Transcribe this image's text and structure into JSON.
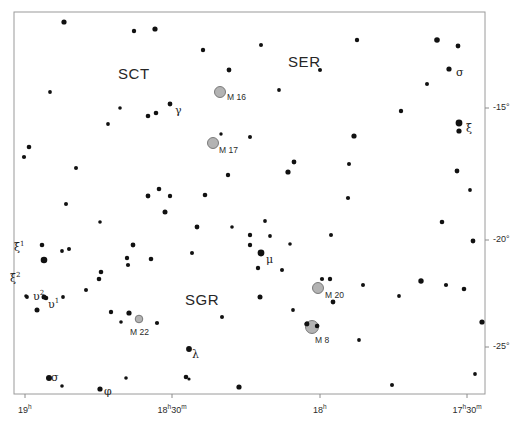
{
  "figure": {
    "kind": "star-chart",
    "background_color": "#ffffff",
    "frame_color": "#9a9a9a",
    "star_color": "#111111",
    "nebula_fill": "#b3b3b3",
    "nebula_stroke": "#6f6f6f",
    "tick_color": "#8c8c8c",
    "width": 521,
    "height": 424
  },
  "frame": {
    "x": 14,
    "y": 12,
    "w": 471,
    "h": 382
  },
  "constellation_labels": [
    {
      "name": "constellation-label-sct",
      "text": "SCT",
      "x": 118,
      "y": 65
    },
    {
      "name": "constellation-label-ser",
      "text": "SER",
      "x": 288,
      "y": 53
    },
    {
      "name": "constellation-label-sgr",
      "text": "SGR",
      "x": 185,
      "y": 291
    }
  ],
  "deep_sky_objects": [
    {
      "name": "messier-16",
      "label": "M 16",
      "x": 220,
      "y": 92,
      "r": 5.5,
      "label_dx": 7,
      "label_dy": 4
    },
    {
      "name": "messier-17",
      "label": "M 17",
      "x": 213,
      "y": 143,
      "r": 5.5,
      "label_dx": 6,
      "label_dy": 6
    },
    {
      "name": "messier-20",
      "label": "M 20",
      "x": 318,
      "y": 288,
      "r": 5.5,
      "label_dx": 7,
      "label_dy": 6
    },
    {
      "name": "messier-8",
      "label": "M 8",
      "x": 312,
      "y": 327,
      "r": 6.5,
      "label_dx": 3,
      "label_dy": 12
    },
    {
      "name": "messier-22",
      "label": "M 22",
      "x": 139,
      "y": 319,
      "r": 3.8,
      "label_dx": -9,
      "label_dy": 12
    }
  ],
  "greek_labels": [
    {
      "name": "star-label-gamma-sct",
      "base": "γ",
      "sup": "",
      "x": 175,
      "y": 104
    },
    {
      "name": "star-label-sigma-ser",
      "base": "σ",
      "sup": "",
      "x": 456,
      "y": 66
    },
    {
      "name": "star-label-xi-ser",
      "base": "ξ",
      "sup": "",
      "x": 466,
      "y": 122
    },
    {
      "name": "star-label-mu-sgr",
      "base": "μ",
      "sup": "",
      "x": 266,
      "y": 253
    },
    {
      "name": "star-label-xi1-sgr",
      "base": "ξ",
      "sup": "1",
      "x": 14,
      "y": 240
    },
    {
      "name": "star-label-xi2-sgr",
      "base": "ξ",
      "sup": "2",
      "x": 10,
      "y": 271
    },
    {
      "name": "star-label-upsilon2-sgr",
      "base": "υ",
      "sup": "2",
      "x": 33,
      "y": 289
    },
    {
      "name": "star-label-upsilon1-sgr",
      "base": "υ",
      "sup": "1",
      "x": 48,
      "y": 297
    },
    {
      "name": "star-label-lambda-sgr",
      "base": "λ",
      "sup": "",
      "x": 192,
      "y": 348
    },
    {
      "name": "star-label-sigma-sgr",
      "base": "σ",
      "sup": "",
      "x": 51,
      "y": 371
    },
    {
      "name": "star-label-phi-sgr",
      "base": "φ",
      "sup": "",
      "x": 104,
      "y": 385
    }
  ],
  "axes": {
    "dec_ticks": [
      {
        "name": "dec-tick-minus15",
        "text": "-15°",
        "value": -15,
        "y": 108
      },
      {
        "name": "dec-tick-minus20",
        "text": "-20°",
        "value": -20,
        "y": 240
      },
      {
        "name": "dec-tick-minus25",
        "text": "-25°",
        "value": -25,
        "y": 347
      }
    ],
    "ra_ticks": [
      {
        "name": "ra-tick-19h",
        "base": "19",
        "unit": "h",
        "minutes": "",
        "x": 25,
        "value": 19.0
      },
      {
        "name": "ra-tick-18h30m",
        "base": "18",
        "unit": "h",
        "minutes": "30",
        "minutes_unit": "m",
        "x": 172,
        "value": 18.5
      },
      {
        "name": "ra-tick-18h",
        "base": "18",
        "unit": "h",
        "minutes": "",
        "x": 320,
        "value": 18.0
      },
      {
        "name": "ra-tick-17h30m",
        "base": "17",
        "unit": "h",
        "minutes": "30",
        "minutes_unit": "m",
        "x": 467,
        "value": 17.5
      }
    ]
  },
  "chart_data": {
    "type": "scatter",
    "title": "",
    "xlabel": "Right Ascension",
    "ylabel": "Declination",
    "xlim": [
      19.0,
      17.4
    ],
    "ylim": [
      -27.5,
      -12.0
    ],
    "grid": false,
    "legend": null,
    "stars": [
      {
        "x": 64,
        "y": 22,
        "r": 2.6
      },
      {
        "x": 155,
        "y": 29,
        "r": 2.6
      },
      {
        "x": 134,
        "y": 31,
        "r": 2.2
      },
      {
        "x": 203,
        "y": 50,
        "r": 2.2
      },
      {
        "x": 203,
        "y": 50,
        "r": 0.1
      },
      {
        "x": 202,
        "y": 49,
        "r": 0.1
      },
      {
        "x": 261,
        "y": 45,
        "r": 2.0
      },
      {
        "x": 357,
        "y": 40,
        "r": 2.2
      },
      {
        "x": 437,
        "y": 40,
        "r": 2.8
      },
      {
        "x": 458,
        "y": 46,
        "r": 2.4
      },
      {
        "x": 50,
        "y": 92,
        "r": 1.9
      },
      {
        "x": 120,
        "y": 108,
        "r": 1.8
      },
      {
        "x": 170,
        "y": 104,
        "r": 2.4
      },
      {
        "x": 156,
        "y": 113,
        "r": 2.3
      },
      {
        "x": 148,
        "y": 116,
        "r": 2.3
      },
      {
        "x": 108,
        "y": 124,
        "r": 1.9
      },
      {
        "x": 229,
        "y": 70,
        "r": 2.4
      },
      {
        "x": 279,
        "y": 90,
        "r": 1.9
      },
      {
        "x": 320,
        "y": 70,
        "r": 2.0
      },
      {
        "x": 449,
        "y": 69,
        "r": 2.6
      },
      {
        "x": 427,
        "y": 84,
        "r": 2.0
      },
      {
        "x": 401,
        "y": 111,
        "r": 2.2
      },
      {
        "x": 459,
        "y": 123,
        "r": 3.4
      },
      {
        "x": 459,
        "y": 131,
        "r": 2.6
      },
      {
        "x": 29,
        "y": 147,
        "r": 2.3
      },
      {
        "x": 24,
        "y": 157,
        "r": 2.1
      },
      {
        "x": 221,
        "y": 134,
        "r": 1.7
      },
      {
        "x": 250,
        "y": 137,
        "r": 2.0
      },
      {
        "x": 354,
        "y": 136,
        "r": 2.6
      },
      {
        "x": 294,
        "y": 162,
        "r": 2.4
      },
      {
        "x": 349,
        "y": 164,
        "r": 2.0
      },
      {
        "x": 228,
        "y": 175,
        "r": 2.2
      },
      {
        "x": 159,
        "y": 189,
        "r": 2.3
      },
      {
        "x": 170,
        "y": 196,
        "r": 2.2
      },
      {
        "x": 66,
        "y": 204,
        "r": 2.0
      },
      {
        "x": 178,
        "y": 196,
        "r": 0.1
      },
      {
        "x": 76,
        "y": 168,
        "r": 2.0
      },
      {
        "x": 148,
        "y": 196,
        "r": 2.4
      },
      {
        "x": 288,
        "y": 172,
        "r": 2.6
      },
      {
        "x": 348,
        "y": 198,
        "r": 2.1
      },
      {
        "x": 457,
        "y": 171,
        "r": 2.4
      },
      {
        "x": 470,
        "y": 190,
        "r": 1.9
      },
      {
        "x": 205,
        "y": 195,
        "r": 2.3
      },
      {
        "x": 100,
        "y": 222,
        "r": 1.8
      },
      {
        "x": 165,
        "y": 212,
        "r": 2.5
      },
      {
        "x": 250,
        "y": 235,
        "r": 2.2
      },
      {
        "x": 250,
        "y": 245,
        "r": 2.2
      },
      {
        "x": 261,
        "y": 253,
        "r": 3.4
      },
      {
        "x": 258,
        "y": 268,
        "r": 2.2
      },
      {
        "x": 197,
        "y": 227,
        "r": 2.4
      },
      {
        "x": 232,
        "y": 227,
        "r": 1.8
      },
      {
        "x": 265,
        "y": 221,
        "r": 1.9
      },
      {
        "x": 290,
        "y": 244,
        "r": 1.8
      },
      {
        "x": 331,
        "y": 235,
        "r": 2.0
      },
      {
        "x": 442,
        "y": 222,
        "r": 2.3
      },
      {
        "x": 473,
        "y": 241,
        "r": 2.4
      },
      {
        "x": 133,
        "y": 245,
        "r": 2.4
      },
      {
        "x": 44,
        "y": 260,
        "r": 3.3
      },
      {
        "x": 42,
        "y": 245,
        "r": 2.3
      },
      {
        "x": 69,
        "y": 249,
        "r": 2.0
      },
      {
        "x": 26,
        "y": 296,
        "r": 1.8
      },
      {
        "x": 29,
        "y": 298,
        "r": 0.1
      },
      {
        "x": 72,
        "y": 246,
        "r": 0.1
      },
      {
        "x": 27,
        "y": 297,
        "r": 1.9
      },
      {
        "x": 46,
        "y": 298,
        "r": 2.3
      },
      {
        "x": 44,
        "y": 297,
        "r": 2.5
      },
      {
        "x": 37,
        "y": 310,
        "r": 2.5
      },
      {
        "x": 63,
        "y": 297,
        "r": 1.9
      },
      {
        "x": 99,
        "y": 279,
        "r": 2.3
      },
      {
        "x": 86,
        "y": 290,
        "r": 2.0
      },
      {
        "x": 76,
        "y": 290,
        "r": 0.1
      },
      {
        "x": 127,
        "y": 258,
        "r": 2.2
      },
      {
        "x": 128,
        "y": 265,
        "r": 2.1
      },
      {
        "x": 101,
        "y": 272,
        "r": 2.3
      },
      {
        "x": 151,
        "y": 259,
        "r": 2.3
      },
      {
        "x": 192,
        "y": 253,
        "r": 2.0
      },
      {
        "x": 129,
        "y": 313,
        "r": 2.6
      },
      {
        "x": 157,
        "y": 323,
        "r": 2.1
      },
      {
        "x": 222,
        "y": 317,
        "r": 2.0
      },
      {
        "x": 121,
        "y": 322,
        "r": 1.8
      },
      {
        "x": 111,
        "y": 312,
        "r": 2.2
      },
      {
        "x": 118,
        "y": 311,
        "r": 0.1
      },
      {
        "x": 62,
        "y": 251,
        "r": 1.9
      },
      {
        "x": 330,
        "y": 279,
        "r": 2.2
      },
      {
        "x": 333,
        "y": 302,
        "r": 2.4
      },
      {
        "x": 307,
        "y": 324,
        "r": 2.6
      },
      {
        "x": 317,
        "y": 326,
        "r": 2.4
      },
      {
        "x": 260,
        "y": 297,
        "r": 2.5
      },
      {
        "x": 270,
        "y": 236,
        "r": 1.9
      },
      {
        "x": 363,
        "y": 285,
        "r": 2.0
      },
      {
        "x": 358,
        "y": 288,
        "r": 0.1
      },
      {
        "x": 399,
        "y": 296,
        "r": 1.9
      },
      {
        "x": 421,
        "y": 281,
        "r": 2.7
      },
      {
        "x": 446,
        "y": 285,
        "r": 2.1
      },
      {
        "x": 464,
        "y": 289,
        "r": 2.3
      },
      {
        "x": 482,
        "y": 322,
        "r": 2.6
      },
      {
        "x": 359,
        "y": 340,
        "r": 1.9
      },
      {
        "x": 475,
        "y": 374,
        "r": 1.9
      },
      {
        "x": 189,
        "y": 349,
        "r": 2.9
      },
      {
        "x": 49,
        "y": 378,
        "r": 3.0
      },
      {
        "x": 62,
        "y": 386,
        "r": 1.8
      },
      {
        "x": 100,
        "y": 389,
        "r": 2.6
      },
      {
        "x": 126,
        "y": 378,
        "r": 1.8
      },
      {
        "x": 186,
        "y": 377,
        "r": 2.3
      },
      {
        "x": 189,
        "y": 379,
        "r": 1.6
      },
      {
        "x": 239,
        "y": 387,
        "r": 2.6
      },
      {
        "x": 392,
        "y": 385,
        "r": 2.0
      },
      {
        "x": 293,
        "y": 310,
        "r": 1.9
      },
      {
        "x": 282,
        "y": 270,
        "r": 2.0
      },
      {
        "x": 214,
        "y": 288,
        "r": 0.1
      },
      {
        "x": 445,
        "y": 210,
        "r": 0.1
      },
      {
        "x": 403,
        "y": 245,
        "r": 0.1
      },
      {
        "x": 164,
        "y": 58,
        "r": 0.1
      }
    ]
  }
}
